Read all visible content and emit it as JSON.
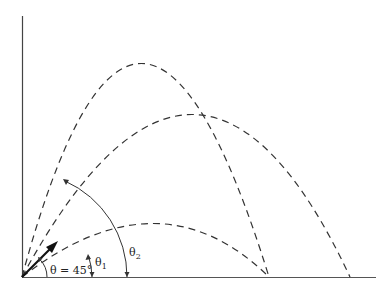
{
  "diagram": {
    "labels": {
      "theta_main": "θ = 45°",
      "theta1_base": "θ",
      "theta1_sub": "1",
      "theta2_base": "θ",
      "theta2_sub": "2"
    },
    "trajectories": [
      {
        "name": "high-angle",
        "angle": "θ2",
        "peak": [
          172,
          40
        ],
        "landing": [
          269,
          277
        ]
      },
      {
        "name": "45-degree",
        "angle": "45°",
        "peak": [
          235,
          113
        ],
        "landing": [
          350,
          277
        ]
      },
      {
        "name": "low-angle",
        "angle": "θ1",
        "peak": [
          180,
          224
        ],
        "landing": [
          269,
          277
        ]
      }
    ],
    "colors": {
      "line": "#333333",
      "background": "#ffffff"
    }
  }
}
